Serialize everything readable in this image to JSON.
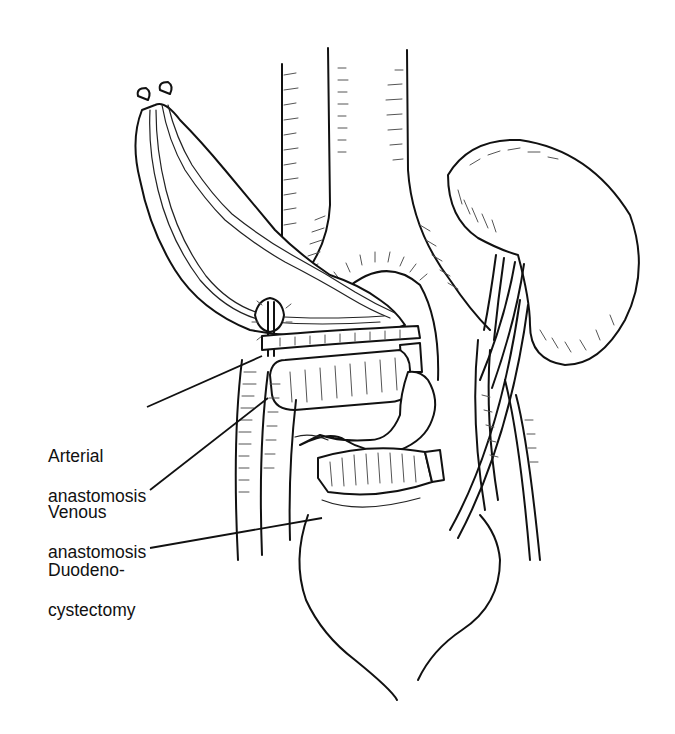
{
  "figure": {
    "ink_color": "#111111",
    "background": "#ffffff"
  },
  "labels": [
    {
      "id": "arterial",
      "line1": "Arterial",
      "line2": "anastomosis"
    },
    {
      "id": "venous",
      "line1": "Venous",
      "line2": "anastomosis"
    },
    {
      "id": "duodeno",
      "line1": "Duodeno-",
      "line2": "cystectomy"
    }
  ]
}
